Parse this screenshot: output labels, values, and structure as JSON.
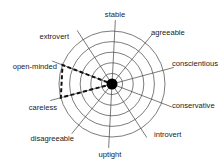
{
  "chart_data": {
    "type": "radar",
    "title": "",
    "axes": [
      "stable",
      "agreeable",
      "conscientious",
      "conservative",
      "introvert",
      "uptight",
      "disagreeable",
      "careless",
      "open-minded",
      "extrovert"
    ],
    "rings": 5,
    "range": [
      0,
      5
    ],
    "series": [
      {
        "name": "profile",
        "style": "dashed",
        "color": "#111111",
        "values": [
          0,
          0,
          0,
          0,
          0,
          0,
          0,
          5,
          5,
          0
        ]
      }
    ],
    "grid": true,
    "legend": null
  },
  "layout": {
    "center": [
      112,
      84
    ],
    "outer_radius": 53,
    "spoke_radius": 64,
    "start_angle_deg": -87,
    "center_dot_radius": 5.5,
    "colors": {
      "grid": "#444444",
      "series": "#111111",
      "text": "#222222",
      "background": "#ffffff"
    }
  },
  "labels": [
    {
      "text": "stable",
      "x": 115,
      "y": 17,
      "anchor": "middle"
    },
    {
      "text": "agreeable",
      "x": 151,
      "y": 35,
      "anchor": "start"
    },
    {
      "text": "conscientious",
      "x": 172,
      "y": 66,
      "anchor": "start"
    },
    {
      "text": "conservative",
      "x": 172,
      "y": 108,
      "anchor": "start"
    },
    {
      "text": "introvert",
      "x": 154,
      "y": 137,
      "anchor": "start"
    },
    {
      "text": "uptight",
      "x": 110,
      "y": 157,
      "anchor": "middle"
    },
    {
      "text": "disagreeable",
      "x": 74,
      "y": 141,
      "anchor": "end"
    },
    {
      "text": "careless",
      "x": 57,
      "y": 110,
      "anchor": "end"
    },
    {
      "text": "open-minded",
      "x": 57,
      "y": 69,
      "anchor": "end"
    },
    {
      "text": "extrovert",
      "x": 69,
      "y": 39,
      "anchor": "end"
    }
  ]
}
